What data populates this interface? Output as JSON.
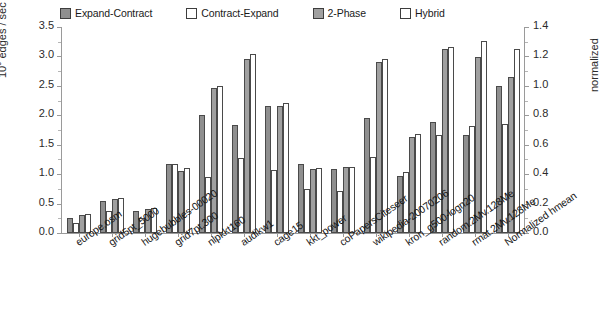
{
  "legend": {
    "items": [
      {
        "label": "Expand-Contract",
        "color": "#8f8f8f"
      },
      {
        "label": "Contract-Expand",
        "color": "#ffffff"
      },
      {
        "label": "2-Phase",
        "color": "#a0a0a0"
      },
      {
        "label": "Hybrid",
        "color": "#ffffff"
      }
    ]
  },
  "axes": {
    "left_title": "10⁹ edges / sec",
    "left_title_base": "10",
    "left_title_exp": "9",
    "left_title_rest": " edges / sec",
    "right_title": "normalized",
    "left_ticks": [
      "3.5",
      "3.0",
      "2.5",
      "2.0",
      "1.5",
      "1.0",
      "0.5",
      "0.0"
    ],
    "right_ticks": [
      "1.4",
      "1.2",
      "1.0",
      "0.8",
      "0.6",
      "0.4",
      "0.2",
      "0.0"
    ]
  },
  "chart_data": {
    "type": "bar",
    "title": "",
    "xlabel": "",
    "ylabel": "10^9 edges / sec",
    "y2label": "normalized",
    "ylim": [
      0,
      3.5
    ],
    "y2lim": [
      0,
      1.4
    ],
    "grid": false,
    "legend_position": "top",
    "note": "Last category 'Normalized hmean' is plotted against the right-hand normalized axis.",
    "categories": [
      "europe.osm",
      "grid5pt_5000",
      "hugebubbles-00020",
      "grid7pt.300",
      "nlpkkt160",
      "audikw1",
      "cage15",
      "kkt_power",
      "coPapersCiteseer",
      "wikipedia-20070206",
      "kron_g500-logn20",
      "random.2Mv.128Me",
      "rmat.2Mv.128Me",
      "Normalized hmean"
    ],
    "series": [
      {
        "name": "Expand-Contract",
        "color": "#8f8f8f",
        "values": [
          0.26,
          0.54,
          0.37,
          1.17,
          2.0,
          1.83,
          2.16,
          1.18,
          1.08,
          1.96,
          0.97,
          1.88,
          1.67,
          1.0
        ],
        "axis": "left"
      },
      {
        "name": "Contract-Expand",
        "color": "#ffffff",
        "values": [
          0.17,
          0.38,
          0.25,
          1.17,
          0.95,
          1.27,
          1.07,
          0.74,
          0.72,
          1.3,
          1.03,
          1.66,
          1.82,
          0.74
        ],
        "axis": "left"
      },
      {
        "name": "2-Phase",
        "color": "#a0a0a0",
        "values": [
          0.31,
          0.57,
          0.4,
          1.05,
          2.47,
          2.96,
          2.16,
          1.08,
          1.12,
          2.9,
          1.63,
          3.13,
          2.99,
          1.06
        ],
        "axis": "left"
      },
      {
        "name": "Hybrid",
        "color": "#ffffff",
        "values": [
          0.33,
          0.6,
          0.43,
          1.1,
          2.5,
          3.05,
          2.21,
          1.1,
          1.13,
          2.95,
          1.68,
          3.16,
          3.27,
          1.25
        ],
        "axis": "left"
      }
    ]
  }
}
